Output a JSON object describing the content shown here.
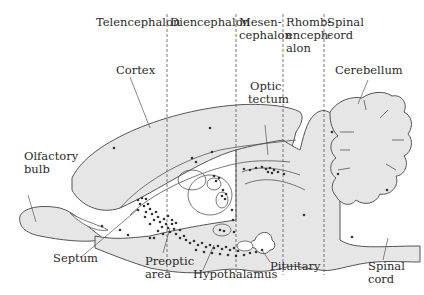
{
  "figure": {
    "fill_color": "#e6e6e6",
    "stroke_color": "#555555",
    "dot_color": "#333333",
    "divider_style": "dashed"
  },
  "divisions": [
    {
      "label_lines": [
        "Telencephalon"
      ],
      "x": 167
    },
    {
      "label_lines": [
        "Diencephalon"
      ],
      "x": 236
    },
    {
      "label_lines": [
        "Mesen-",
        "cephalon"
      ],
      "x": 283
    },
    {
      "label_lines": [
        "Rhomb-",
        "enceph-",
        "alon"
      ],
      "x": 324
    },
    {
      "label_lines": [
        "Spinal",
        "cord"
      ],
      "x": null
    }
  ],
  "labels": {
    "telencephalon": "Telencephalon",
    "diencephalon": "Diencephalon",
    "mesen1": "Mesen-",
    "mesen2": "cephalon",
    "rhomb1": "Rhomb-",
    "rhomb2": "enceph-",
    "rhomb3": "alon",
    "spinal_top1": "Spinal",
    "spinal_top2": "cord",
    "cortex": "Cortex",
    "optic1": "Optic",
    "optic2": "tectum",
    "cerebellum": "Cerebellum",
    "olfactory1": "Olfactory",
    "olfactory2": "bulb",
    "septum": "Septum",
    "preoptic1": "Preoptic",
    "preoptic2": "area",
    "hypothalamus": "Hypothalamus",
    "pituitary": "Pituitary",
    "spinal_bottom1": "Spinal",
    "spinal_bottom2": "cord"
  }
}
